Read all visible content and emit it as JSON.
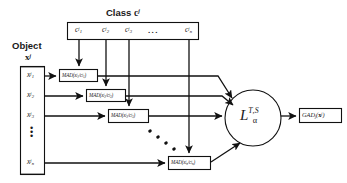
{
  "figure": {
    "labels": {
      "class_header": "Class",
      "class_header_var": "c",
      "class_header_sup": "j",
      "object_header": "Object",
      "object_var": "x",
      "object_sup": "j"
    },
    "class_vector": {
      "name": "class-vector-box",
      "items": [
        {
          "base": "c",
          "sup": "j",
          "sub": "1"
        },
        {
          "base": "c",
          "sup": "j",
          "sub": "2"
        },
        {
          "base": "c",
          "sup": "j",
          "sub": "3"
        },
        {
          "base": "...",
          "sup": "",
          "sub": ""
        },
        {
          "base": "c",
          "sup": "j",
          "sub": "n"
        }
      ],
      "ellipsis": "..."
    },
    "object_vector": {
      "name": "object-vector-box",
      "items": [
        {
          "base": "x",
          "sup": "j",
          "sub": "1"
        },
        {
          "base": "x",
          "sup": "j",
          "sub": "2"
        },
        {
          "base": "x",
          "sup": "j",
          "sub": "3"
        },
        {
          "base": "x",
          "sup": "j",
          "sub": "n"
        }
      ],
      "vertical_ellipsis": "⋮"
    },
    "mad_nodes": [
      {
        "text": "MAD(x₁ʲ/c₁ʲ)",
        "fn": "MAD",
        "arg_num_base": "x",
        "arg_num_sub": "1",
        "arg_den_base": "c",
        "arg_den_sub": "1",
        "sup": "j"
      },
      {
        "text": "MAD(x₂ʲ/c₂ʲ)",
        "fn": "MAD",
        "arg_num_base": "x",
        "arg_num_sub": "2",
        "arg_den_base": "c",
        "arg_den_sub": "2",
        "sup": "j"
      },
      {
        "text": "MAD(x₃ʲ/c₃ʲ)",
        "fn": "MAD",
        "arg_num_base": "x",
        "arg_num_sub": "3",
        "arg_den_base": "c",
        "arg_den_sub": "3",
        "sup": "j"
      },
      {
        "text": "MAD(xₙʲ/cₙʲ)",
        "fn": "MAD",
        "arg_num_base": "x",
        "arg_num_sub": "n",
        "arg_den_base": "c",
        "arg_den_sub": "n",
        "sup": "j"
      }
    ],
    "aggregator": {
      "name": "loss-aggregator-node",
      "base": "L",
      "sub": "α",
      "sup": "T,S"
    },
    "output": {
      "name": "output-node",
      "fn": "GAD",
      "fn_sub": "j",
      "arg_base": "x",
      "arg_sup": "j"
    },
    "diagonal_ellipsis": "⋰",
    "colors": {
      "stroke": "#111111",
      "text": "#1a1a1a",
      "background": "#ffffff"
    }
  }
}
